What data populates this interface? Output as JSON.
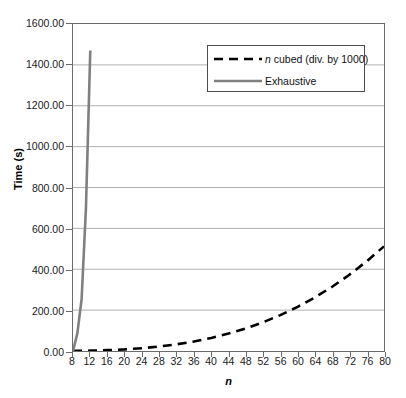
{
  "chart_data": {
    "type": "line",
    "title": "",
    "xlabel": "n",
    "ylabel": "Time (s)",
    "xlim": [
      8,
      80
    ],
    "ylim": [
      0,
      1600
    ],
    "xticks": [
      8,
      12,
      16,
      20,
      24,
      28,
      32,
      36,
      40,
      44,
      48,
      52,
      56,
      60,
      64,
      68,
      72,
      76,
      80
    ],
    "yticks": [
      0,
      200,
      400,
      600,
      800,
      1000,
      1200,
      1400,
      1600
    ],
    "xtick_labels": [
      "8",
      "12",
      "16",
      "20",
      "24",
      "28",
      "32",
      "36",
      "40",
      "44",
      "48",
      "52",
      "56",
      "60",
      "64",
      "68",
      "72",
      "76",
      "80"
    ],
    "ytick_labels": [
      "0.00",
      "200.00",
      "400.00",
      "600.00",
      "800.00",
      "1000.00",
      "1200.00",
      "1400.00",
      "1600.00"
    ],
    "grid": "horizontal",
    "legend_position": "upper-right",
    "series": [
      {
        "name": "n cubed (div. by 1000)",
        "name_prefix_italic": "n",
        "name_rest": " cubed (div. by 1000)",
        "style": "dashed",
        "color": "#000000",
        "width": 2.6,
        "x": [
          8,
          12,
          16,
          20,
          24,
          28,
          32,
          36,
          40,
          44,
          48,
          52,
          56,
          60,
          64,
          68,
          72,
          76,
          80
        ],
        "values": [
          0.51,
          1.73,
          4.1,
          8.0,
          13.82,
          21.95,
          32.77,
          46.66,
          64.0,
          85.18,
          110.59,
          140.61,
          175.62,
          216.0,
          262.14,
          314.43,
          373.25,
          438.98,
          512.0
        ]
      },
      {
        "name": "Exhaustive",
        "style": "solid",
        "color": "#808080",
        "width": 2.6,
        "x": [
          8,
          9,
          10,
          11,
          12
        ],
        "values": [
          0,
          85,
          255,
          700,
          1470
        ]
      }
    ]
  },
  "legend": {
    "items": [
      {
        "label_italic": "n",
        "label_rest": " cubed (div. by 1000)",
        "style": "dashed",
        "color": "#000000"
      },
      {
        "label_italic": "",
        "label_rest": "Exhaustive",
        "style": "solid",
        "color": "#808080"
      }
    ]
  },
  "colors": {
    "axis": "#6b6b6b",
    "grid": "#b0b0b0",
    "background": "#ffffff",
    "text": "#1a1a1a",
    "cubic_series": "#000000",
    "exhaustive_series": "#808080"
  }
}
